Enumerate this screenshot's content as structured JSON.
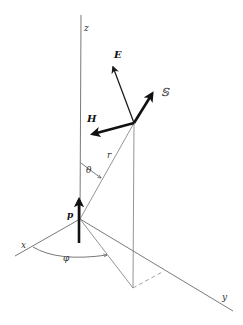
{
  "figure": {
    "labels": {
      "z_axis": "z",
      "x_axis": "x",
      "y_axis": "y",
      "electric_field": "E",
      "magnetic_field": "H",
      "poynting_vector": "𝕊",
      "radius": "r",
      "polar_angle": "θ",
      "azimuth_angle": "φ",
      "dipole": "p"
    },
    "colors": {
      "lines": "#6a6a6a",
      "vectors": "#111111",
      "background": "#ffffff"
    }
  }
}
